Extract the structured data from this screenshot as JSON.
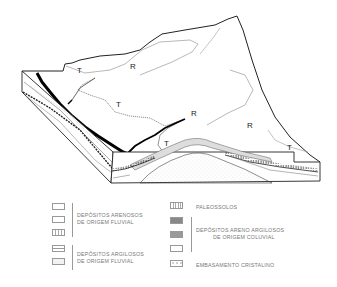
{
  "diagram": {
    "terrain_labels": [
      {
        "text": "T",
        "x": 77,
        "y": 73
      },
      {
        "text": "R",
        "x": 130,
        "y": 69
      },
      {
        "text": "T",
        "x": 116,
        "y": 107
      },
      {
        "text": "R",
        "x": 191,
        "y": 116
      },
      {
        "text": "R",
        "x": 247,
        "y": 128
      },
      {
        "text": "T",
        "x": 164,
        "y": 146
      },
      {
        "text": "T",
        "x": 287,
        "y": 150
      }
    ]
  },
  "legend": {
    "left": {
      "groups": [
        {
          "label_lines": [
            "DEPÓSITOS ARENOSOS",
            "DE ORIGEM FLUVIAL"
          ],
          "swatches": [
            "plain",
            "plain",
            "dashed-pattern"
          ]
        },
        {
          "label_lines": [
            "DEPÓSITOS ARGILOSOS",
            "DE ORIGEM FLUVIAL"
          ],
          "swatches": [
            "dash-clay",
            "light-clay"
          ]
        }
      ]
    },
    "right": {
      "paleosols": {
        "label": "PALEOSSOLOS",
        "swatch": "hatched-soil"
      },
      "colluvial": {
        "label_lines": [
          "DEPÓSITOS ARENO ARGILOSOS",
          "DE ORIGEM COLUVIAL"
        ],
        "swatches": [
          "dark-dotted",
          "dark-stippled",
          "plain"
        ]
      },
      "basement": {
        "label": "EMBASAMENTO CRISTALINO",
        "swatch": "dotted-basement"
      }
    }
  }
}
